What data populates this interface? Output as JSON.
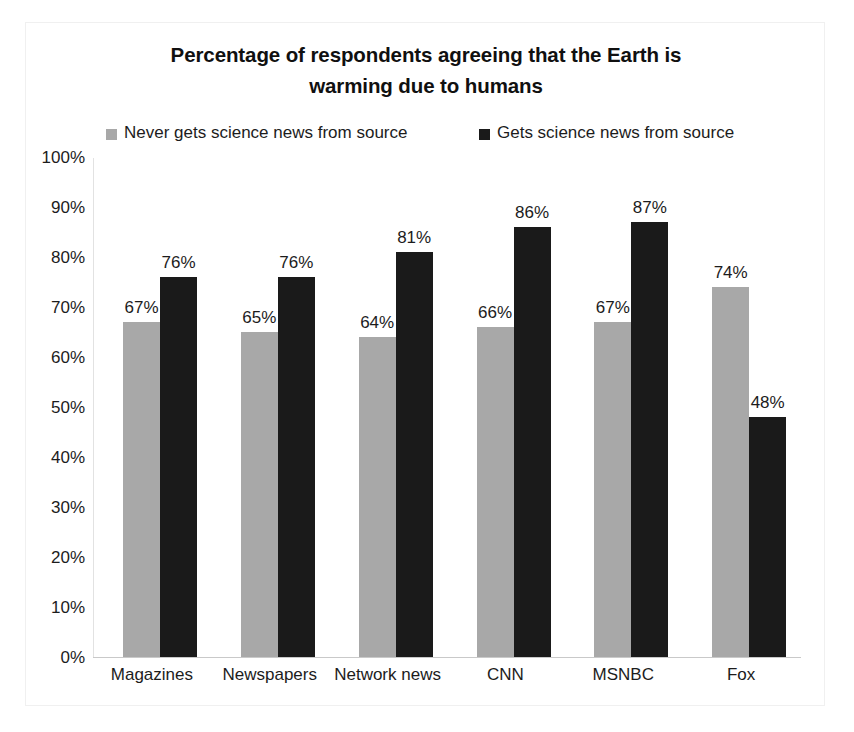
{
  "chart_data": {
    "type": "bar",
    "title": "Percentage of respondents agreeing that the Earth is warming due to humans",
    "title_lines": [
      "Percentage of respondents agreeing that the Earth is",
      "warming due to humans"
    ],
    "xlabel": "",
    "ylabel": "",
    "ylim": [
      0,
      100
    ],
    "grid": false,
    "legend_position": "top",
    "categories": [
      "Magazines",
      "Newspapers",
      "Network news",
      "CNN",
      "MSNBC",
      "Fox"
    ],
    "series": [
      {
        "name": "Never gets science news from source",
        "color": "#a8a8a8",
        "values": [
          67,
          65,
          64,
          66,
          67,
          74
        ],
        "labels": [
          "67%",
          "65%",
          "64%",
          "66%",
          "67%",
          "74%"
        ]
      },
      {
        "name": "Gets science news from source",
        "color": "#1a1a1a",
        "values": [
          76,
          76,
          81,
          86,
          87,
          48
        ],
        "labels": [
          "76%",
          "76%",
          "81%",
          "86%",
          "87%",
          "48%"
        ]
      }
    ],
    "y_ticks": [
      "100%",
      "90%",
      "80%",
      "70%",
      "60%",
      "50%",
      "40%",
      "30%",
      "20%",
      "10%",
      "0%"
    ],
    "y_tick_values": [
      100,
      90,
      80,
      70,
      60,
      50,
      40,
      30,
      20,
      10,
      0
    ]
  }
}
